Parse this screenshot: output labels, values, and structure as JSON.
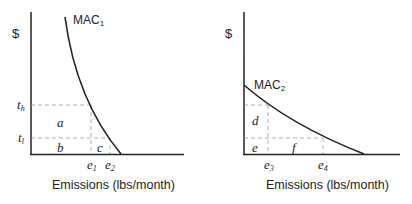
{
  "left_panel": {
    "y_label": "$",
    "curve_label": "MAC",
    "curve_sub": "1",
    "x_label": "Emissions (lbs/month)",
    "y_ticks": [
      {
        "t": "t",
        "s": "h"
      },
      {
        "t": "t",
        "s": "l"
      }
    ],
    "x_ticks": [
      {
        "t": "e",
        "s": "1"
      },
      {
        "t": "e",
        "s": "2"
      }
    ],
    "areas": [
      "a",
      "b",
      "c"
    ]
  },
  "right_panel": {
    "y_label": "$",
    "curve_label": "MAC",
    "curve_sub": "2",
    "x_label": "Emissions (lbs/month)",
    "x_ticks": [
      {
        "t": "e",
        "s": "3"
      },
      {
        "t": "e",
        "s": "4"
      }
    ],
    "areas": [
      "d",
      "e",
      "f"
    ]
  }
}
